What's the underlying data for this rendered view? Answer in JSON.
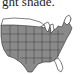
{
  "caption": {
    "text": "ght shade."
  },
  "map": {
    "subject": "United States (contiguous) state map",
    "colors": {
      "shaded": "#8a8a8a",
      "unshaded": "#ffffff",
      "border": "#2a2a2a"
    },
    "unshaded_regions": [
      "northern-tier",
      "michigan",
      "new-england",
      "florida"
    ]
  }
}
